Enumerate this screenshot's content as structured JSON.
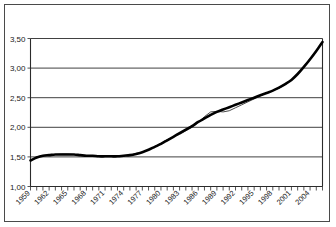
{
  "chart_data": {
    "type": "line",
    "title": "",
    "subtitle": "",
    "xlabel": "",
    "ylabel": "",
    "xlim": [
      1959,
      2006
    ],
    "ylim": [
      1.0,
      3.5
    ],
    "y_ticks": [
      "1,00",
      "1,50",
      "2,00",
      "2,50",
      "3,00",
      "3,50"
    ],
    "y_tick_values": [
      1.0,
      1.5,
      2.0,
      2.5,
      3.0,
      3.5
    ],
    "x_tick_labels": [
      "1959",
      "1962",
      "1965",
      "1968",
      "1971",
      "1974",
      "1977",
      "1980",
      "1983",
      "1986",
      "1989",
      "1992",
      "1995",
      "1998",
      "2001",
      "2004"
    ],
    "x_tick_values": [
      1959,
      1962,
      1965,
      1968,
      1971,
      1974,
      1977,
      1980,
      1983,
      1986,
      1989,
      1992,
      1995,
      1998,
      2001,
      2004
    ],
    "x_minor_step": 1,
    "grid": "horizontal",
    "legend": "none",
    "decimal_separator": ",",
    "x": [
      1959,
      1960,
      1961,
      1962,
      1963,
      1964,
      1965,
      1966,
      1967,
      1968,
      1969,
      1970,
      1971,
      1972,
      1973,
      1974,
      1975,
      1976,
      1977,
      1978,
      1979,
      1980,
      1981,
      1982,
      1983,
      1984,
      1985,
      1986,
      1987,
      1988,
      1989,
      1990,
      1991,
      1992,
      1993,
      1994,
      1995,
      1996,
      1997,
      1998,
      1999,
      2000,
      2001,
      2002,
      2003,
      2004,
      2005,
      2006
    ],
    "series": [
      {
        "name": "actual",
        "style": "thin-jagged",
        "color": "#333333",
        "values": [
          1.43,
          1.5,
          1.52,
          1.53,
          1.54,
          1.55,
          1.55,
          1.54,
          1.53,
          1.52,
          1.52,
          1.51,
          1.51,
          1.51,
          1.52,
          1.52,
          1.53,
          1.56,
          1.58,
          1.62,
          1.67,
          1.73,
          1.79,
          1.84,
          1.88,
          1.94,
          2.0,
          2.08,
          2.18,
          2.26,
          2.27,
          2.26,
          2.28,
          2.33,
          2.38,
          2.43,
          2.48,
          2.53,
          2.58,
          2.62,
          2.66,
          2.72,
          2.8,
          2.9,
          3.03,
          3.16,
          3.3,
          3.43
        ]
      },
      {
        "name": "trend",
        "style": "thick-smooth",
        "color": "#000000",
        "values": [
          1.44,
          1.49,
          1.52,
          1.53,
          1.54,
          1.54,
          1.54,
          1.54,
          1.53,
          1.52,
          1.52,
          1.51,
          1.51,
          1.51,
          1.51,
          1.52,
          1.53,
          1.55,
          1.58,
          1.62,
          1.67,
          1.72,
          1.78,
          1.84,
          1.9,
          1.96,
          2.02,
          2.09,
          2.15,
          2.21,
          2.26,
          2.3,
          2.34,
          2.38,
          2.42,
          2.46,
          2.5,
          2.54,
          2.58,
          2.62,
          2.67,
          2.73,
          2.8,
          2.9,
          3.02,
          3.15,
          3.29,
          3.44
        ]
      }
    ]
  }
}
